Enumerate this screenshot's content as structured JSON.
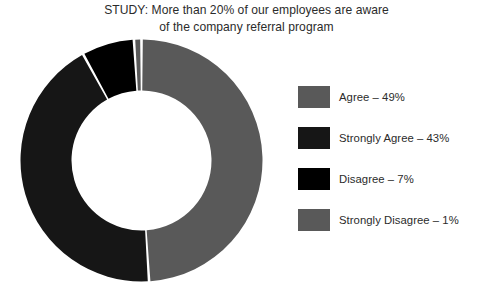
{
  "chart_data": {
    "type": "pie",
    "variant": "donut",
    "title": "STUDY: More than 20% of our employees are aware\nof the company referral program",
    "xlabel": "",
    "ylabel": "",
    "grid": false,
    "legend_position": "right",
    "value_unit": "percent",
    "hole_ratio": 0.58,
    "start_angle_deg": 0,
    "direction": "clockwise",
    "categories": [
      "Agree",
      "Strongly Agree",
      "Disagree",
      "Strongly Disagree"
    ],
    "values": [
      49,
      43,
      7,
      1
    ],
    "slice_colors": [
      "#595959",
      "#161616",
      "#000000",
      "#595959"
    ],
    "series": [
      {
        "name": "Employee awareness of referral program",
        "values": [
          49,
          43,
          7,
          1
        ]
      }
    ],
    "slices": [
      {
        "label": "Agree",
        "value": 49,
        "display": "Agree – 49%",
        "color": "#595959"
      },
      {
        "label": "Strongly Agree",
        "value": 43,
        "display": "Strongly Agree – 43%",
        "color": "#161616"
      },
      {
        "label": "Disagree",
        "value": 7,
        "display": "Disagree – 7%",
        "color": "#000000"
      },
      {
        "label": "Strongly Disagree",
        "value": 1,
        "display": "Strongly Disagree – 1%",
        "color": "#595959"
      }
    ]
  },
  "chart": {
    "title": "STUDY: More than 20% of our employees are aware\nof the company referral program",
    "background_color": "#ffffff",
    "separator_color": "#ffffff",
    "center_x": 121.5,
    "center_y": 121.5,
    "outer_radius": 121,
    "inner_radius": 70
  },
  "legend": {
    "items": [
      {
        "label": "Agree – 49%",
        "color": "#595959"
      },
      {
        "label": "Strongly Agree – 43%",
        "color": "#161616"
      },
      {
        "label": "Disagree – 7%",
        "color": "#000000"
      },
      {
        "label": "Strongly Disagree – 1%",
        "color": "#595959"
      }
    ]
  }
}
